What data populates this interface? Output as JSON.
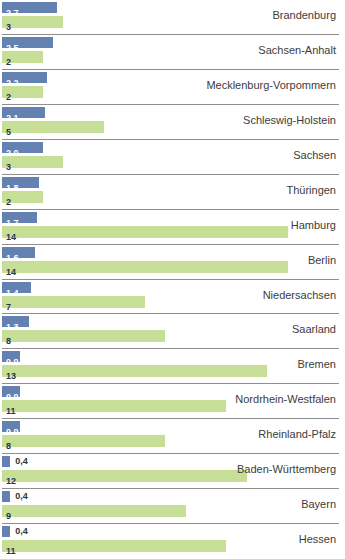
{
  "chart_data": {
    "type": "bar",
    "orientation": "horizontal",
    "title": "",
    "xlabel": "",
    "ylabel": "",
    "grid": false,
    "legend": false,
    "row_separator_color": "#8f8f8f",
    "label_color": "#3c3c3c",
    "xlim": [
      0,
      16.9
    ],
    "categories": [
      "Brandenburg",
      "Sachsen-Anhalt",
      "Mecklenburg-Vorpommern",
      "Schleswig-Holstein",
      "Sachsen",
      "Thüringen",
      "Hamburg",
      "Berlin",
      "Niedersachsen",
      "Saarland",
      "Bremen",
      "Nordrhein-Westfalen",
      "Rheinland-Pfalz",
      "Baden-Württemberg",
      "Bayern",
      "Hessen"
    ],
    "series": [
      {
        "name": "",
        "color": "#6381b1",
        "text_color": "#ffffff",
        "values": [
          2.7,
          2.5,
          2.2,
          2.1,
          2.0,
          1.8,
          1.7,
          1.6,
          1.4,
          1.3,
          0.9,
          0.9,
          0.9,
          0.4,
          0.4,
          0.4
        ],
        "labels": [
          "2,7",
          "2,5",
          "2,2",
          "2,1",
          "2,0",
          "1,8",
          "1,7",
          "1,6",
          "1,4",
          "1,3",
          "0,9",
          "0,9",
          "0,9",
          "0,4",
          "0,4",
          "0,4"
        ]
      },
      {
        "name": "",
        "color": "#c7de96",
        "text_color": "#1f3550",
        "values": [
          3,
          2,
          2,
          5,
          3,
          2,
          14,
          14,
          7,
          8,
          13,
          11,
          8,
          12,
          9,
          11
        ],
        "labels": [
          "3",
          "2",
          "2",
          "5",
          "3",
          "2",
          "14",
          "14",
          "7",
          "8",
          "13",
          "11",
          "8",
          "12",
          "9",
          "11"
        ]
      }
    ]
  }
}
